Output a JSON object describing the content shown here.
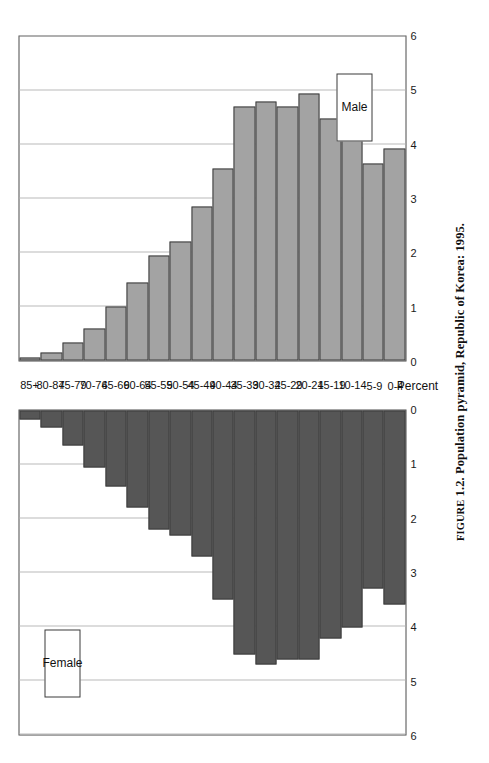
{
  "figure": {
    "caption_prefix": "FIGURE",
    "caption_number": "1.2.",
    "caption_text": "Population pyramid, Republic of Korea: 1995."
  },
  "legend": {
    "female_label": "Female",
    "male_label": "Male"
  },
  "axis": {
    "value_title": "Percent"
  },
  "chart_data": {
    "type": "bar",
    "title": "Population pyramid, Republic of Korea: 1995.",
    "subtitle": "",
    "orientation": "horizontal-pyramid",
    "xlabel": "Percent",
    "ylabel": "",
    "xlim": [
      0,
      6
    ],
    "ticks": [
      0,
      1,
      2,
      3,
      4,
      5,
      6
    ],
    "tick_labels": [
      "0",
      "1",
      "2",
      "3",
      "4",
      "5",
      "6"
    ],
    "grid": true,
    "legend_position": "inside-top-left / inside-bottom-right",
    "categories": [
      "85+",
      "80-84",
      "75-79",
      "70-74",
      "65-69",
      "60-64",
      "55-59",
      "50-54",
      "45-49",
      "40-44",
      "35-39",
      "30-34",
      "25-29",
      "20-24",
      "15-19",
      "10-14",
      "5-9",
      "0-4"
    ],
    "series": [
      {
        "name": "Female",
        "color": "#565656",
        "side": "left",
        "values": [
          0.17,
          0.32,
          0.65,
          1.05,
          1.4,
          1.8,
          2.2,
          2.32,
          2.7,
          3.5,
          4.52,
          4.7,
          4.62,
          4.62,
          4.22,
          4.02,
          3.3,
          3.6
        ]
      },
      {
        "name": "Male",
        "color": "#a3a3a3",
        "side": "right",
        "values": [
          0.05,
          0.14,
          0.33,
          0.6,
          1.0,
          1.45,
          1.95,
          2.2,
          2.85,
          3.55,
          4.7,
          4.8,
          4.7,
          4.95,
          4.48,
          4.38,
          3.65,
          3.92
        ]
      }
    ]
  }
}
